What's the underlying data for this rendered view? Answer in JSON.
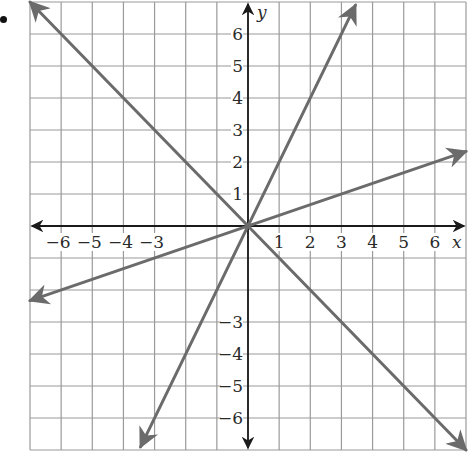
{
  "chart_data": {
    "type": "line",
    "title": "",
    "xlabel": "x",
    "ylabel": "y",
    "xlim": [
      -7,
      7
    ],
    "ylim": [
      -7,
      7
    ],
    "grid": true,
    "grid_step": 1,
    "x_tick_labels": [
      "−6",
      "−5",
      "−4",
      "−3",
      "1",
      "2",
      "3",
      "4",
      "5",
      "6"
    ],
    "x_tick_values": [
      -6,
      -5,
      -4,
      -3,
      1,
      2,
      3,
      4,
      5,
      6
    ],
    "y_tick_labels": [
      "6",
      "5",
      "4",
      "3",
      "2",
      "1",
      "−3",
      "−4",
      "−5",
      "−6"
    ],
    "y_tick_values": [
      6,
      5,
      4,
      3,
      2,
      1,
      -3,
      -4,
      -5,
      -6
    ],
    "series": [
      {
        "name": "y = -x",
        "slope": -1,
        "intercept": 0,
        "x": [
          -7,
          7
        ],
        "y": [
          7,
          -7
        ],
        "arrows": "both"
      },
      {
        "name": "y = 2x",
        "slope": 2,
        "intercept": 0,
        "x": [
          -3.45,
          3.45
        ],
        "y": [
          -6.9,
          6.9
        ],
        "arrows": "both"
      },
      {
        "name": "y = x/3",
        "slope": 0.3333,
        "intercept": 0,
        "x": [
          -7,
          7
        ],
        "y": [
          -2.33,
          2.33
        ],
        "arrows": "both"
      }
    ],
    "colors": {
      "lines": "#6b6b6b",
      "axes": "#1a1a1a",
      "grid": "#9a9a9a"
    }
  },
  "layout": {
    "plot_left": 30,
    "plot_top": 2,
    "plot_right": 466,
    "plot_bottom": 450
  }
}
